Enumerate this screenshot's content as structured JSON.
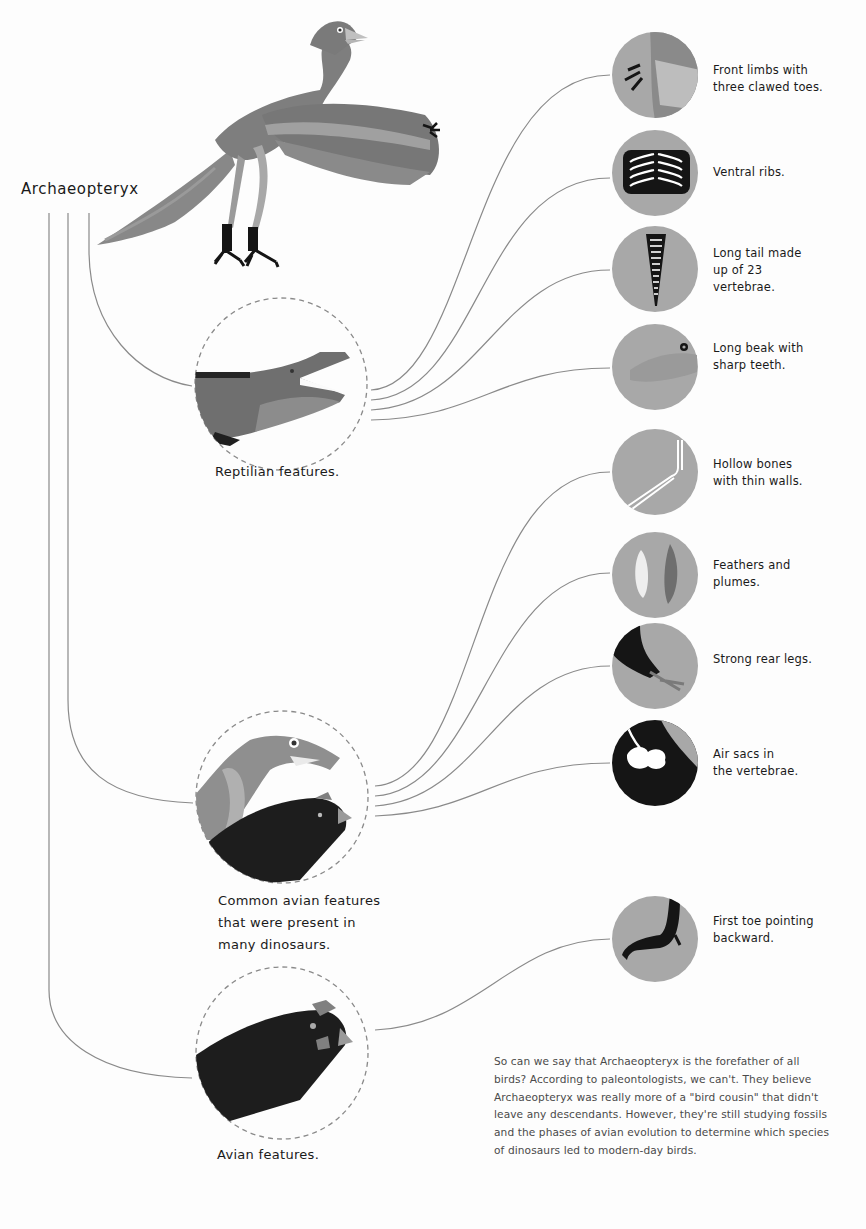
{
  "title": "Archaeopteryx",
  "groups": [
    {
      "id": "reptilian",
      "caption": "Reptilian features.",
      "icon": "crocodile-icon"
    },
    {
      "id": "common-avian",
      "caption": "Common avian features that were present in many dinosaurs.",
      "caption_lines": [
        "Common avian features",
        "that were present in",
        "many dinosaurs."
      ],
      "icon": "dinosaur-and-hen-icon"
    },
    {
      "id": "avian",
      "caption": "Avian features.",
      "icon": "hen-head-icon"
    }
  ],
  "features": [
    {
      "group": "reptilian",
      "lines": [
        "Front limbs with",
        "three clawed toes."
      ],
      "icon": "claw-icon"
    },
    {
      "group": "reptilian",
      "lines": [
        "Ventral ribs."
      ],
      "icon": "ribs-icon"
    },
    {
      "group": "reptilian",
      "lines": [
        "Long tail made",
        "up of 23",
        "vertebrae."
      ],
      "icon": "tail-vertebrae-icon"
    },
    {
      "group": "reptilian",
      "lines": [
        "Long beak with",
        "sharp teeth."
      ],
      "icon": "toothed-beak-icon"
    },
    {
      "group": "common-avian",
      "lines": [
        "Hollow bones",
        "with thin walls."
      ],
      "icon": "hollow-bone-icon"
    },
    {
      "group": "common-avian",
      "lines": [
        "Feathers and",
        "plumes."
      ],
      "icon": "feather-icon"
    },
    {
      "group": "common-avian",
      "lines": [
        "Strong rear legs."
      ],
      "icon": "rear-leg-icon"
    },
    {
      "group": "common-avian",
      "lines": [
        "Air sacs in",
        "the vertebrae."
      ],
      "icon": "air-sac-icon"
    },
    {
      "group": "avian",
      "lines": [
        "First toe pointing",
        "backward."
      ],
      "icon": "bird-foot-icon"
    }
  ],
  "paragraph": "So can we say that Archaeopteryx is the forefather of all birds? According to paleontologists, we can't. They believe Archaeopteryx was really more of a \"bird cousin\" that didn't leave any descendants. However, they're still studying fossils and the phases of avian evolution to determine which species of dinosaurs led to modern-day birds.",
  "colors": {
    "background": "#fdfdfd",
    "line": "#8a8a8a",
    "circle_fill": "#a8a8a8",
    "dark": "#151515",
    "mid_gray": "#777777",
    "light_gray": "#9c9c9c"
  }
}
